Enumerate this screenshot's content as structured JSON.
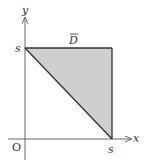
{
  "diagram": {
    "region_label": "D",
    "region_label_overbar": true,
    "axis_x_label": "x",
    "axis_y_label": "y",
    "origin_label": "O",
    "y_tick_label": "s",
    "x_tick_label": "s",
    "region_fill": "#cfcfcf",
    "line_color": "#333333",
    "axis_color": "#666666",
    "vertices": [
      [
        "0",
        "s"
      ],
      [
        "s",
        "s"
      ],
      [
        "s",
        "0"
      ]
    ]
  }
}
